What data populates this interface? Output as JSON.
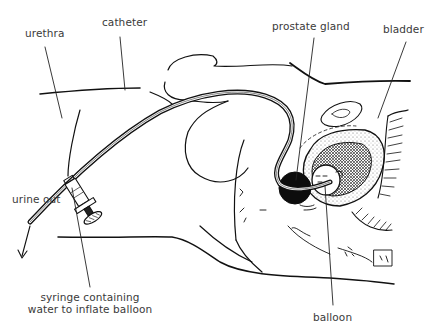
{
  "diagram": {
    "colors": {
      "ink": "#111111",
      "label_text": "#3a3a3a",
      "background": "#ffffff",
      "prostate_fill": "#0d0d0d"
    },
    "labels": {
      "urethra": "urethra",
      "catheter": "catheter",
      "prostate_gland": "prostate gland",
      "bladder": "bladder",
      "urine_out": "urine out",
      "syringe_line1": "syringe containing",
      "syringe_line2": "water to inflate balloon",
      "balloon": "balloon"
    }
  }
}
